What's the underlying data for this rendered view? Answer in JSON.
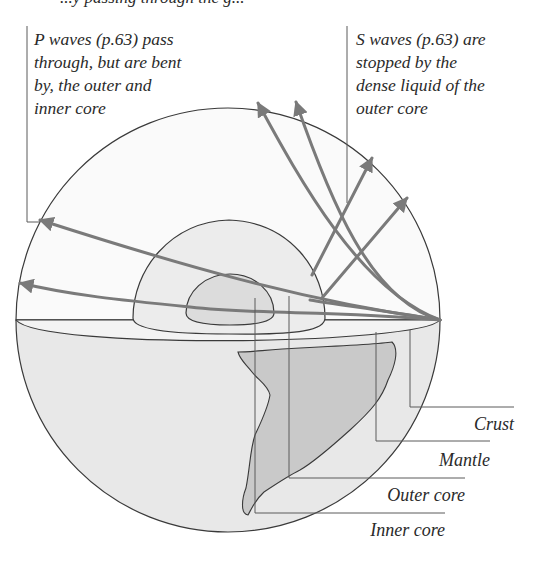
{
  "header": {
    "partial_text": "...y passing through the g..."
  },
  "captions": {
    "p_waves": [
      "P waves (p.63) pass",
      "through, but are bent",
      "by, the outer and",
      "inner core"
    ],
    "s_waves": [
      "S waves (p.63) are",
      "stopped by the",
      "dense liquid of the",
      "outer core"
    ]
  },
  "layers": {
    "crust": "Crust",
    "mantle": "Mantle",
    "outer_core": "Outer core",
    "inner_core": "Inner core"
  },
  "colors": {
    "outline": "#3a3a3a",
    "wave": "#7a7a7a",
    "shell_fill": "#f1f1f1",
    "mantle_fill": "#ebebeb",
    "core_fill": "#dedede",
    "continent_fill": "#c9c9c9",
    "lower_fill": "#e4e4e4"
  }
}
